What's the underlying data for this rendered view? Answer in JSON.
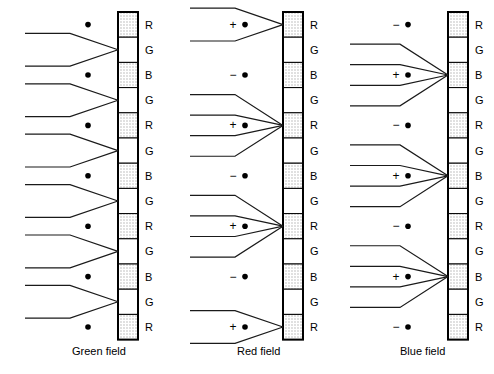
{
  "figure": {
    "background_color": "#ffffff",
    "ink_color": "#000000",
    "phosphor_fill_color": "#d9d9d9"
  },
  "geometry": {
    "width": 494,
    "height": 374,
    "strip_top": 12,
    "strip_cell_height": 25.2,
    "strip_cell_count": 13,
    "strip_width": 20,
    "label_offset_x": 7
  },
  "columns": [
    {
      "id": "green-field",
      "caption": "Green field",
      "caption_x": 72,
      "caption_y": 355,
      "strip_x": 118,
      "ray_start_x": 25,
      "marker_x": 88,
      "stripes": [
        "R",
        "G",
        "B",
        "G",
        "R",
        "G",
        "B",
        "G",
        "R",
        "G",
        "B",
        "G",
        "R"
      ],
      "beam_groups": [
        {
          "target_cell_index": 1,
          "target_letter": "G",
          "ray_count": 2
        },
        {
          "target_cell_index": 3,
          "target_letter": "G",
          "ray_count": 2
        },
        {
          "target_cell_index": 5,
          "target_letter": "G",
          "ray_count": 2
        },
        {
          "target_cell_index": 7,
          "target_letter": "G",
          "ray_count": 2
        },
        {
          "target_cell_index": 9,
          "target_letter": "G",
          "ray_count": 2
        },
        {
          "target_cell_index": 11,
          "target_letter": "G",
          "ray_count": 2
        }
      ],
      "markers": [
        {
          "sign": "",
          "cell_index": 0,
          "letter": "R"
        },
        {
          "sign": "",
          "cell_index": 2,
          "letter": "B"
        },
        {
          "sign": "",
          "cell_index": 4,
          "letter": "R"
        },
        {
          "sign": "",
          "cell_index": 6,
          "letter": "B"
        },
        {
          "sign": "",
          "cell_index": 8,
          "letter": "R"
        },
        {
          "sign": "",
          "cell_index": 10,
          "letter": "B"
        },
        {
          "sign": "",
          "cell_index": 12,
          "letter": "R"
        }
      ]
    },
    {
      "id": "red-field",
      "caption": "Red field",
      "caption_x": 237,
      "caption_y": 355,
      "strip_x": 283,
      "ray_start_x": 190,
      "marker_x": 245,
      "stripes": [
        "R",
        "G",
        "B",
        "G",
        "R",
        "G",
        "B",
        "G",
        "R",
        "G",
        "B",
        "G",
        "R"
      ],
      "beam_groups": [
        {
          "target_cell_index": 0,
          "target_letter": "R",
          "ray_count": 2
        },
        {
          "target_cell_index": 4,
          "target_letter": "R",
          "ray_count": 4
        },
        {
          "target_cell_index": 8,
          "target_letter": "R",
          "ray_count": 4
        },
        {
          "target_cell_index": 12,
          "target_letter": "R",
          "ray_count": 2
        }
      ],
      "markers": [
        {
          "sign": "+",
          "cell_index": 0,
          "letter": "R"
        },
        {
          "sign": "−",
          "cell_index": 2,
          "letter": "B"
        },
        {
          "sign": "+",
          "cell_index": 4,
          "letter": "R"
        },
        {
          "sign": "−",
          "cell_index": 6,
          "letter": "B"
        },
        {
          "sign": "+",
          "cell_index": 8,
          "letter": "R"
        },
        {
          "sign": "−",
          "cell_index": 10,
          "letter": "B"
        },
        {
          "sign": "+",
          "cell_index": 12,
          "letter": "R"
        }
      ]
    },
    {
      "id": "blue-field",
      "caption": "Blue field",
      "caption_x": 400,
      "caption_y": 355,
      "strip_x": 448,
      "ray_start_x": 350,
      "marker_x": 408,
      "stripes": [
        "R",
        "G",
        "B",
        "G",
        "R",
        "G",
        "B",
        "G",
        "R",
        "G",
        "B",
        "G",
        "R"
      ],
      "beam_groups": [
        {
          "target_cell_index": 2,
          "target_letter": "B",
          "ray_count": 4
        },
        {
          "target_cell_index": 6,
          "target_letter": "B",
          "ray_count": 4
        },
        {
          "target_cell_index": 10,
          "target_letter": "B",
          "ray_count": 4
        }
      ],
      "markers": [
        {
          "sign": "−",
          "cell_index": 0,
          "letter": "R"
        },
        {
          "sign": "+",
          "cell_index": 2,
          "letter": "B"
        },
        {
          "sign": "−",
          "cell_index": 4,
          "letter": "R"
        },
        {
          "sign": "+",
          "cell_index": 6,
          "letter": "B"
        },
        {
          "sign": "−",
          "cell_index": 8,
          "letter": "R"
        },
        {
          "sign": "+",
          "cell_index": 10,
          "letter": "B"
        },
        {
          "sign": "−",
          "cell_index": 12,
          "letter": "R"
        }
      ]
    }
  ],
  "legend": {
    "stripe_letters": [
      "R",
      "G",
      "B"
    ],
    "sign_plus": "+",
    "sign_minus": "−"
  }
}
